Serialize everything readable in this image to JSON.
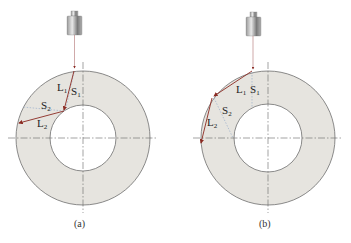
{
  "figure": {
    "panels": [
      {
        "id": "a",
        "caption": "(a)",
        "labels": {
          "L1": {
            "base": "L",
            "sub": "1"
          },
          "S1": {
            "base": "S",
            "sub": "1"
          },
          "S2": {
            "base": "S",
            "sub": "2"
          },
          "L2": {
            "base": "L",
            "sub": "2"
          }
        }
      },
      {
        "id": "b",
        "caption": "(b)",
        "labels": {
          "L1": {
            "base": "L",
            "sub": "1"
          },
          "S1": {
            "base": "S",
            "sub": "1"
          },
          "S2": {
            "base": "S",
            "sub": "2"
          },
          "L2": {
            "base": "L",
            "sub": "2"
          }
        }
      }
    ],
    "colors": {
      "ring_fill": "#e6e4df",
      "ring_stroke": "#6e6e6e",
      "beam_longitudinal": "#8b2a22",
      "beam_shear": "#8fa6c8",
      "centerline": "#666666",
      "transducer": "#8a8a8a"
    }
  }
}
